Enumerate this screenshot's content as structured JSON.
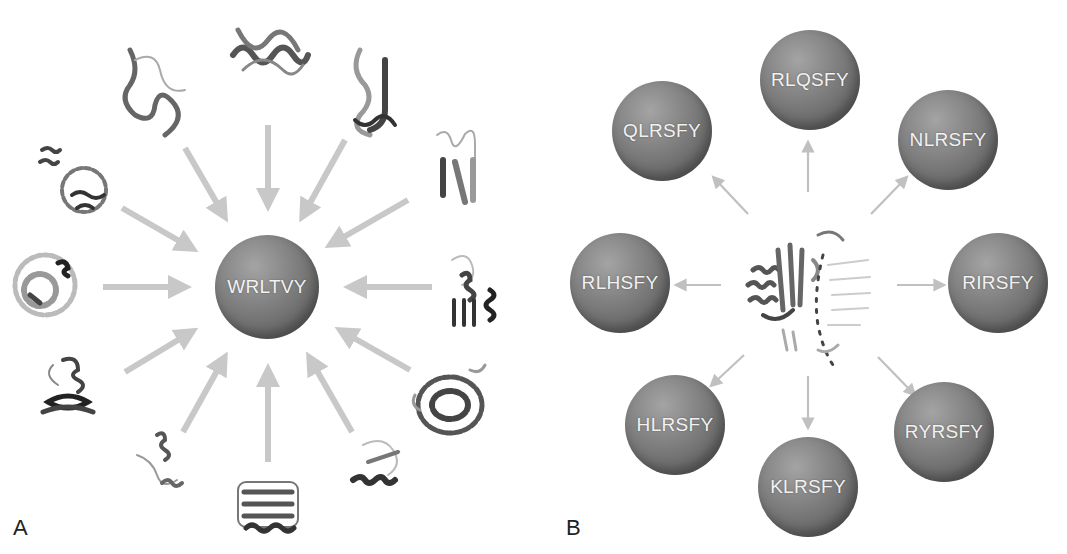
{
  "figure": {
    "panel_a": {
      "label": "A",
      "center_sphere": {
        "text": "WRLTVY",
        "cx": 267,
        "cy": 287,
        "r": 52
      },
      "arrow_color": "#c8c8c8",
      "arrow_direction": "inward",
      "protein_count": 12
    },
    "panel_b": {
      "label": "B",
      "center_protein": "protein-structure",
      "arrow_color": "#c0c0c0",
      "arrow_direction": "outward",
      "spheres": [
        {
          "text": "RLQSFY",
          "cx": 810,
          "cy": 80
        },
        {
          "text": "NLRSFY",
          "cx": 948,
          "cy": 140
        },
        {
          "text": "RIRSFY",
          "cx": 998,
          "cy": 283
        },
        {
          "text": "RYRSFY",
          "cx": 944,
          "cy": 432
        },
        {
          "text": "KLRSFY",
          "cx": 808,
          "cy": 487
        },
        {
          "text": "HLRSFY",
          "cx": 675,
          "cy": 425
        },
        {
          "text": "RLHSFY",
          "cx": 620,
          "cy": 283
        },
        {
          "text": "QLRSFY",
          "cx": 662,
          "cy": 131
        }
      ]
    },
    "sphere_text_color": "#f2f2f2"
  }
}
